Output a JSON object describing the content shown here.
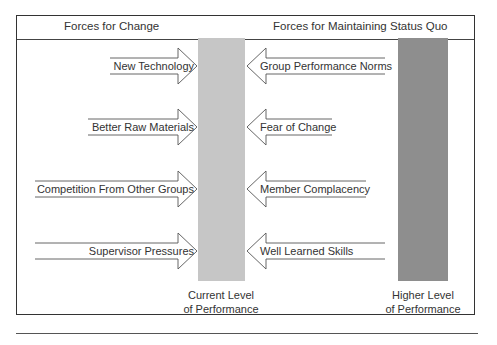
{
  "header": {
    "left_title": "Forces for Change",
    "right_title": "Forces for Maintaining Status Quo"
  },
  "forces_for_change": [
    {
      "label": "New Technology"
    },
    {
      "label": "Better Raw Materials"
    },
    {
      "label": "Competition From Other Groups"
    },
    {
      "label": "Supervisor Pressures"
    }
  ],
  "forces_for_status_quo": [
    {
      "label": "Group Performance Norms"
    },
    {
      "label": "Fear of Change"
    },
    {
      "label": "Member Complacency"
    },
    {
      "label": "Well Learned Skills"
    }
  ],
  "bars": {
    "current": {
      "line1": "Current Level",
      "line2": "of Performance",
      "color": "#c6c6c6"
    },
    "higher": {
      "line1": "Higher Level",
      "line2": "of Performance",
      "color": "#8e8e8e"
    }
  }
}
